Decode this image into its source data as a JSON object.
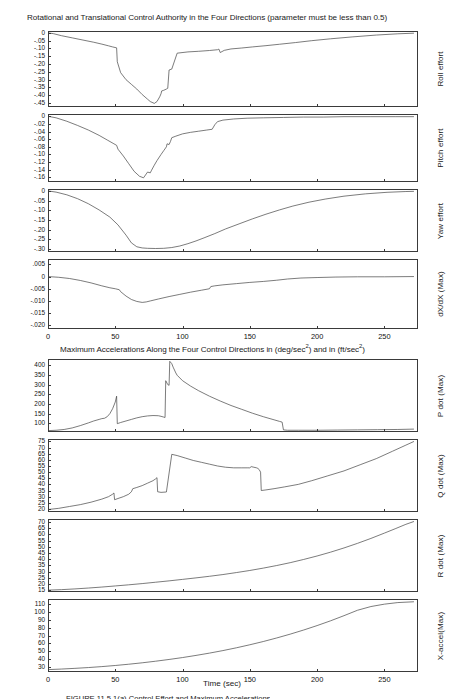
{
  "figure": {
    "top_title": "Rotational and Translational Control Authority in the Four Directions (parameter must be less than 0.5)",
    "mid_title_part1": "Maximum Accelerations Along the Four Control Directions in (deg/sec",
    "mid_title_sup1": "2",
    "mid_title_part2": ") and in (ft/sec",
    "mid_title_sup2": "2",
    "mid_title_part3": ")",
    "xaxis_title": "Time (sec)",
    "caption": "FIGURE 11.5.1(a)  Control Effort and Maximum Accelerations"
  },
  "chart_data": {
    "type": "line",
    "title": "Rotational and Translational Control Authority in the Four Directions (parameter must be less than 0.5)",
    "xlabel": "Time (sec)",
    "grid": false,
    "legend": "none",
    "shared_x": {
      "label": "Time (sec)",
      "xlim": [
        0,
        275
      ],
      "ticks": [
        0,
        50,
        100,
        150,
        200,
        250
      ],
      "tick_labels": [
        "0",
        "50",
        "100",
        "150",
        "200",
        "250"
      ]
    },
    "panels": [
      {
        "name": "roll-effort",
        "ylabel": "Roll effort",
        "ylim": [
          -0.475,
          0.012
        ],
        "yticks": [
          0,
          -0.05,
          -0.1,
          -0.15,
          -0.2,
          -0.25,
          -0.3,
          -0.35,
          -0.4,
          -0.45
        ],
        "ytick_labels": [
          "0",
          "-.05",
          "-.10",
          "-.15",
          "-.20",
          "-.25",
          "-.30",
          "-.35",
          "-.40",
          "-.45"
        ],
        "x": [
          0,
          4,
          10,
          18,
          26,
          34,
          40,
          45,
          48,
          51,
          51.5,
          54,
          58,
          62,
          66,
          70,
          74,
          76,
          79,
          81,
          83,
          84,
          84.5,
          86,
          88,
          89,
          90,
          92,
          96,
          104,
          112,
          120,
          126,
          127,
          128,
          131,
          136,
          144,
          152,
          162,
          172,
          184,
          196,
          210,
          226,
          244,
          260,
          272
        ],
        "y": [
          0.0,
          -0.005,
          -0.018,
          -0.032,
          -0.046,
          -0.06,
          -0.072,
          -0.083,
          -0.09,
          -0.096,
          -0.185,
          -0.255,
          -0.3,
          -0.33,
          -0.36,
          -0.395,
          -0.425,
          -0.44,
          -0.452,
          -0.44,
          -0.41,
          -0.39,
          -0.372,
          -0.368,
          -0.36,
          -0.355,
          -0.238,
          -0.232,
          -0.13,
          -0.122,
          -0.118,
          -0.113,
          -0.108,
          -0.104,
          -0.126,
          -0.112,
          -0.103,
          -0.097,
          -0.09,
          -0.082,
          -0.073,
          -0.062,
          -0.05,
          -0.038,
          -0.026,
          -0.014,
          -0.006,
          -0.002
        ]
      },
      {
        "name": "pitch-effort",
        "ylabel": "Pitch effort",
        "ylim": [
          -0.172,
          0.006
        ],
        "yticks": [
          0,
          -0.02,
          -0.04,
          -0.06,
          -0.08,
          -0.1,
          -0.12,
          -0.14,
          -0.16
        ],
        "ytick_labels": [
          "0",
          "-.02",
          "-.04",
          "-.06",
          "-.08",
          "-.10",
          "-.12",
          "-.14",
          "-.16"
        ],
        "x": [
          0,
          6,
          14,
          22,
          30,
          38,
          44,
          49,
          51,
          52,
          56,
          60,
          64,
          68,
          71,
          73,
          74,
          76,
          77,
          79,
          81,
          84,
          86,
          88,
          88.5,
          90,
          91,
          92,
          95,
          100,
          106,
          112,
          118,
          122,
          124,
          126,
          130,
          138,
          148,
          160,
          175,
          190,
          205,
          220,
          240,
          258,
          272
        ],
        "y": [
          0.0,
          -0.004,
          -0.013,
          -0.024,
          -0.036,
          -0.05,
          -0.062,
          -0.072,
          -0.076,
          -0.086,
          -0.104,
          -0.124,
          -0.144,
          -0.157,
          -0.161,
          -0.151,
          -0.146,
          -0.148,
          -0.141,
          -0.128,
          -0.116,
          -0.1,
          -0.09,
          -0.08,
          -0.072,
          -0.074,
          -0.066,
          -0.056,
          -0.052,
          -0.046,
          -0.042,
          -0.039,
          -0.036,
          -0.034,
          -0.022,
          -0.014,
          -0.01,
          -0.007,
          -0.005,
          -0.004,
          -0.003,
          -0.002,
          -0.002,
          -0.001,
          -0.001,
          -0.001,
          -0.001
        ]
      },
      {
        "name": "yaw-effort",
        "ylabel": "Yaw effort",
        "ylim": [
          -0.315,
          0.01
        ],
        "yticks": [
          0,
          -0.05,
          -0.1,
          -0.15,
          -0.2,
          -0.25,
          -0.3
        ],
        "ytick_labels": [
          "0",
          "-.05",
          "-.10",
          "-.15",
          "-.20",
          "-.25",
          "-.30"
        ],
        "x": [
          0,
          6,
          14,
          22,
          30,
          38,
          46,
          52,
          58,
          62,
          66,
          70,
          74,
          80,
          86,
          92,
          98,
          104,
          110,
          116,
          124,
          132,
          142,
          152,
          162,
          172,
          182,
          194,
          206,
          220,
          236,
          252,
          266,
          272
        ],
        "y": [
          0.0,
          -0.006,
          -0.02,
          -0.04,
          -0.066,
          -0.098,
          -0.135,
          -0.175,
          -0.228,
          -0.268,
          -0.288,
          -0.294,
          -0.296,
          -0.297,
          -0.296,
          -0.292,
          -0.284,
          -0.272,
          -0.258,
          -0.242,
          -0.22,
          -0.196,
          -0.17,
          -0.144,
          -0.12,
          -0.098,
          -0.078,
          -0.058,
          -0.042,
          -0.027,
          -0.015,
          -0.007,
          -0.003,
          -0.002
        ]
      },
      {
        "name": "dxdx-max",
        "ylabel": "dX/dX (Max)",
        "ylim": [
          -0.0215,
          0.0072
        ],
        "yticks": [
          0.005,
          0,
          -0.005,
          -0.01,
          -0.015,
          -0.02
        ],
        "ytick_labels": [
          ".005",
          "0",
          "-.005",
          "-.010",
          "-.015",
          "-.020"
        ],
        "x": [
          0,
          8,
          16,
          24,
          32,
          40,
          46,
          50,
          53,
          54,
          58,
          62,
          66,
          70,
          73,
          76,
          82,
          90,
          98,
          106,
          114,
          120,
          121,
          124,
          130,
          140,
          150,
          160,
          170,
          178,
          188,
          200,
          214,
          230,
          250,
          272
        ],
        "y": [
          0.0,
          -0.0003,
          -0.0008,
          -0.0016,
          -0.0026,
          -0.0038,
          -0.0046,
          -0.005,
          -0.0054,
          -0.0062,
          -0.008,
          -0.0094,
          -0.0102,
          -0.0106,
          -0.0104,
          -0.01,
          -0.0092,
          -0.0082,
          -0.0073,
          -0.0064,
          -0.0056,
          -0.005,
          -0.0041,
          -0.0038,
          -0.0034,
          -0.0029,
          -0.0024,
          -0.002,
          -0.0015,
          -0.001,
          -0.0006,
          -0.0004,
          -0.0002,
          -0.0001,
          -0.0001,
          0.0
        ]
      },
      {
        "name": "p-dot-max",
        "ylabel": "P dot (Max)",
        "ylim": [
          55,
          432
        ],
        "yticks": [
          400,
          350,
          300,
          250,
          200,
          150,
          100
        ],
        "ytick_labels": [
          "400",
          "350",
          "300",
          "250",
          "200",
          "150",
          "100"
        ],
        "x": [
          0,
          6,
          12,
          18,
          24,
          30,
          34,
          38,
          40,
          42,
          44,
          46,
          48,
          50,
          51,
          51.5,
          54,
          58,
          62,
          66,
          70,
          74,
          78,
          82,
          84,
          86,
          87,
          87.5,
          89,
          90,
          90.5,
          92,
          93,
          94,
          95,
          96,
          100,
          106,
          112,
          120,
          128,
          136,
          144,
          152,
          160,
          168,
          172,
          174,
          175,
          178,
          186,
          200,
          215,
          230,
          245,
          260,
          272
        ],
        "y": [
          62,
          64,
          68,
          76,
          88,
          102,
          112,
          120,
          124,
          126,
          134,
          150,
          175,
          210,
          240,
          98,
          104,
          112,
          120,
          128,
          134,
          138,
          140,
          139,
          136,
          132,
          130,
          320,
          300,
          296,
          420,
          408,
          390,
          375,
          360,
          348,
          320,
          292,
          268,
          240,
          215,
          192,
          172,
          152,
          134,
          118,
          110,
          106,
          66,
          64,
          64,
          64,
          65,
          66,
          67,
          68,
          70
        ]
      },
      {
        "name": "q-dot-max",
        "ylabel": "Q dot (Max)",
        "ylim": [
          17.5,
          77
        ],
        "yticks": [
          75,
          70,
          65,
          60,
          55,
          50,
          45,
          40,
          35,
          30,
          25,
          20
        ],
        "ytick_labels": [
          "75",
          "70",
          "65",
          "60",
          "55",
          "50",
          "45",
          "40",
          "35",
          "30",
          "25",
          "20"
        ],
        "x": [
          0,
          8,
          16,
          24,
          32,
          40,
          45,
          48,
          49,
          49.5,
          52,
          56,
          60,
          62,
          63,
          66,
          70,
          74,
          78,
          80,
          81,
          81.5,
          84,
          88,
          92,
          96,
          102,
          108,
          114,
          120,
          126,
          132,
          138,
          144,
          148,
          150,
          151,
          153,
          155,
          156,
          157,
          158,
          158.5,
          162,
          168,
          176,
          186,
          196,
          208,
          220,
          232,
          244,
          256,
          266,
          272
        ],
        "y": [
          19.5,
          20.5,
          22,
          23.5,
          25.5,
          28,
          30,
          32,
          33,
          27.5,
          28.5,
          30,
          32,
          34,
          36.5,
          37.5,
          39,
          41,
          43,
          44.5,
          45.5,
          34,
          33.5,
          33.8,
          64.5,
          63.5,
          61.5,
          59.5,
          58,
          56.5,
          55,
          54,
          53.5,
          53.5,
          53.5,
          53.5,
          54.5,
          54,
          53.5,
          53,
          52,
          50,
          35,
          35.5,
          36.5,
          38,
          40,
          43,
          47,
          51,
          56,
          61,
          67,
          72,
          75
        ]
      },
      {
        "name": "r-dot-max",
        "ylabel": "R dot (Max)",
        "ylim": [
          13.5,
          72.5
        ],
        "yticks": [
          70,
          65,
          60,
          55,
          50,
          45,
          40,
          35,
          30,
          25,
          20,
          15
        ],
        "ytick_labels": [
          "70",
          "65",
          "60",
          "55",
          "50",
          "45",
          "40",
          "35",
          "30",
          "25",
          "20",
          "15"
        ],
        "x": [
          0,
          10,
          20,
          30,
          40,
          50,
          60,
          70,
          80,
          90,
          100,
          110,
          120,
          130,
          140,
          150,
          160,
          170,
          180,
          190,
          200,
          210,
          220,
          230,
          240,
          250,
          258,
          266,
          272
        ],
        "y": [
          15,
          15.4,
          16,
          16.7,
          17.5,
          18.4,
          19.3,
          20.3,
          21.4,
          22.5,
          23.7,
          24.9,
          26.2,
          27.6,
          29.2,
          30.9,
          32.8,
          34.9,
          37.2,
          39.8,
          42.6,
          45.7,
          49.1,
          52.8,
          56.8,
          61.1,
          64.6,
          68.2,
          70.5
        ]
      },
      {
        "name": "x-accel-max",
        "ylabel": "X-accel(Max)",
        "ylim": [
          24,
          116
        ],
        "yticks": [
          110,
          100,
          90,
          80,
          70,
          60,
          50,
          40,
          30
        ],
        "ytick_labels": [
          "110",
          "100",
          "90",
          "80",
          "70",
          "60",
          "50",
          "40",
          "30"
        ],
        "x": [
          0,
          10,
          20,
          30,
          40,
          50,
          60,
          70,
          80,
          90,
          100,
          110,
          120,
          130,
          140,
          150,
          160,
          170,
          180,
          190,
          200,
          210,
          220,
          230,
          240,
          250,
          260,
          272
        ],
        "y": [
          27,
          27.7,
          28.6,
          29.6,
          30.8,
          32.2,
          33.8,
          35.6,
          37.6,
          39.8,
          42.2,
          44.9,
          47.8,
          51.0,
          54.5,
          58.3,
          62.4,
          66.9,
          71.7,
          76.9,
          82.5,
          88.5,
          95.0,
          101.8,
          106.5,
          109.5,
          111.5,
          112.5
        ]
      }
    ]
  }
}
